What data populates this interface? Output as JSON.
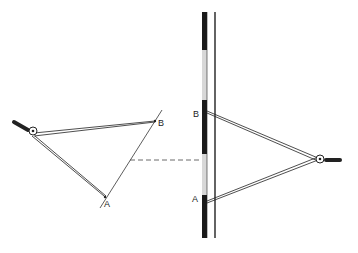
{
  "figure": {
    "left_drawing": {
      "point_a_label": "A",
      "point_b_label": "B"
    },
    "right_drawing": {
      "point_a_label": "A",
      "point_b_label": "B"
    },
    "colors": {
      "line": "#222222",
      "ruler_dark": "#1a1a1a",
      "ruler_light": "#d8d8d8",
      "background": "#ffffff"
    }
  }
}
